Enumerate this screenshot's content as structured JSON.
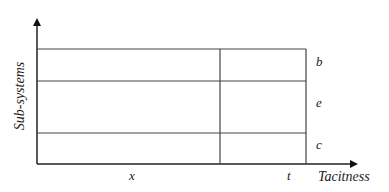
{
  "diagram": {
    "y_axis_label": "Sub-systems",
    "x_axis_label": "Tacitness",
    "row_labels": [
      "b",
      "e",
      "c"
    ],
    "column_labels": [
      "x",
      "t"
    ],
    "colors": {
      "line": "#333333",
      "text": "#222222",
      "background": "#ffffff"
    }
  }
}
